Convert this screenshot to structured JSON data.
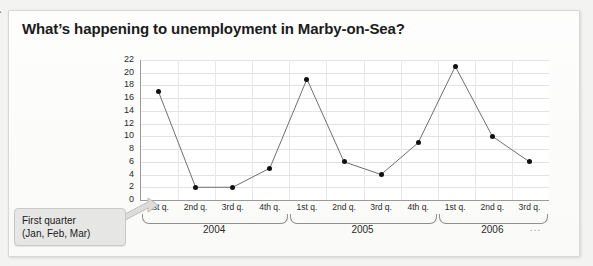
{
  "page": {
    "title": "What’s happening to unemployment in Marby-on-Sea?"
  },
  "callout": {
    "line1": "First quarter",
    "line2": "(Jan, Feb, Mar)"
  },
  "axis": {
    "y_title": "Unemployment (thousands)",
    "y_ticks": [
      "0",
      "2",
      "4",
      "6",
      "8",
      "10",
      "12",
      "14",
      "16",
      "18",
      "20",
      "22"
    ],
    "continuation": "..."
  },
  "chart_data": {
    "type": "line",
    "title": "What’s happening to unemployment in Marby-on-Sea?",
    "xlabel": "",
    "ylabel": "Unemployment (thousands)",
    "ylim": [
      0,
      22
    ],
    "ytick_step": 2,
    "grid": true,
    "legend": "none",
    "categories": [
      "1st q.",
      "2nd q.",
      "3rd q.",
      "4th q.",
      "1st q.",
      "2nd q.",
      "3rd q.",
      "4th q.",
      "1st q.",
      "2nd q.",
      "3rd q."
    ],
    "groups": [
      {
        "label": "2004",
        "quarters": [
          "1st q.",
          "2nd q.",
          "3rd q.",
          "4th q."
        ],
        "values": [
          17,
          2,
          2,
          5
        ]
      },
      {
        "label": "2005",
        "quarters": [
          "1st q.",
          "2nd q.",
          "3rd q.",
          "4th q."
        ],
        "values": [
          19,
          6,
          4,
          9
        ]
      },
      {
        "label": "2006",
        "quarters": [
          "1st q.",
          "2nd q.",
          "3rd q."
        ],
        "values": [
          21,
          10,
          6
        ]
      }
    ],
    "values": [
      17,
      2,
      2,
      5,
      19,
      6,
      4,
      9,
      21,
      10,
      6
    ],
    "marker": "filled-circle",
    "line_color": "#6f6f6f",
    "marker_color": "#111111"
  }
}
